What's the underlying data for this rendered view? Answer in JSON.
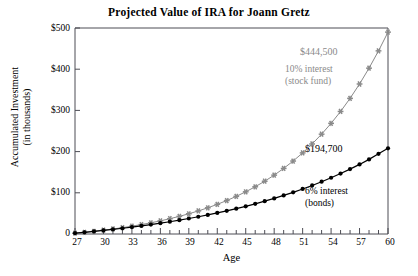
{
  "chart_data": {
    "type": "line",
    "title": "Projected Value of IRA for Joann Gretz",
    "xlabel": "Age",
    "ylabel_line1": "Accumulated Investment",
    "ylabel_line2": "(in thousands)",
    "xlim": [
      27,
      60
    ],
    "ylim": [
      0,
      500
    ],
    "grid": false,
    "legend_position": "inline-annotation",
    "x_tick_labels": [
      "27",
      "30",
      "33",
      "36",
      "39",
      "42",
      "45",
      "48",
      "51",
      "54",
      "57",
      "60"
    ],
    "x_tick_label_values": [
      27,
      30,
      33,
      36,
      39,
      42,
      45,
      48,
      51,
      54,
      57,
      60
    ],
    "x_minor_ticks_every": 1,
    "y_tick_labels": [
      "0",
      "$100",
      "$200",
      "$300",
      "$400",
      "$500"
    ],
    "y_tick_values": [
      0,
      100,
      200,
      300,
      400,
      500
    ],
    "x": [
      27,
      28,
      29,
      30,
      31,
      32,
      33,
      34,
      35,
      36,
      37,
      38,
      39,
      40,
      41,
      42,
      43,
      44,
      45,
      46,
      47,
      48,
      49,
      50,
      51,
      52,
      53,
      54,
      55,
      56,
      57,
      58,
      59,
      60
    ],
    "series": [
      {
        "name": "10% interest (stock fund)",
        "label_line1": "10% interest",
        "label_line2": "(stock fund)",
        "end_value_label": "$444,500",
        "end_value": 444.5,
        "color": "#8a8a8a",
        "marker": "asterisk",
        "values": [
          2.0,
          4.2,
          6.6,
          9.3,
          12.2,
          15.4,
          19.0,
          22.9,
          27.2,
          31.9,
          37.1,
          42.8,
          49.1,
          56.0,
          63.6,
          72.0,
          81.2,
          91.3,
          102.4,
          114.6,
          128.1,
          142.9,
          159.2,
          177.1,
          196.8,
          218.5,
          242.3,
          268.6,
          297.4,
          329.2,
          364.1,
          402.5,
          444.5,
          490.0
        ]
      },
      {
        "name": "6% interest (bonds)",
        "label_line1": "6% interest",
        "label_line2": "(bonds)",
        "end_value_label": "$194,700",
        "end_value": 194.7,
        "color": "#000000",
        "marker": "circle",
        "values": [
          2.0,
          4.1,
          6.3,
          8.7,
          11.2,
          13.9,
          16.7,
          19.7,
          22.9,
          26.3,
          29.8,
          33.6,
          37.6,
          41.9,
          46.4,
          51.1,
          56.2,
          61.5,
          67.2,
          73.2,
          79.6,
          86.4,
          93.6,
          101.2,
          109.3,
          117.8,
          126.9,
          136.5,
          146.7,
          157.5,
          168.9,
          181.1,
          194.7,
          208.0
        ]
      }
    ]
  }
}
